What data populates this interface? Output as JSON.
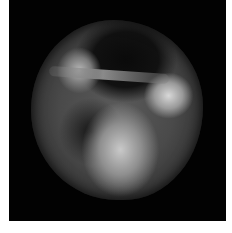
{
  "figure": {
    "colors": {
      "background": "#020202",
      "tissue": "#4a4a4a",
      "highlight": "#cfcfcf",
      "page": "#ffffff"
    }
  }
}
